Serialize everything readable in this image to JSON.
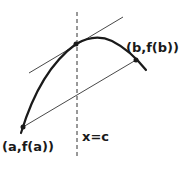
{
  "diagram": {
    "labels": {
      "point_a": "(a,f(a))",
      "point_b": "(b,f(b))",
      "vertical_line": "x=c"
    },
    "colors": {
      "stroke": "#1a1a1a",
      "background": "#ffffff"
    }
  }
}
